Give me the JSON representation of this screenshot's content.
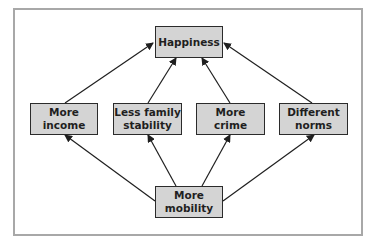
{
  "diagram": {
    "nodes": {
      "happiness": {
        "label": "Happiness"
      },
      "income": {
        "line1": "More",
        "line2": "income"
      },
      "family": {
        "line1": "Less family",
        "line2": "stability"
      },
      "crime": {
        "line1": "More",
        "line2": "crime"
      },
      "norms": {
        "line1": "Different",
        "line2": "norms"
      },
      "mobility": {
        "line1": "More",
        "line2": "mobility"
      }
    },
    "edges": [
      {
        "from": "income",
        "to": "happiness"
      },
      {
        "from": "family",
        "to": "happiness"
      },
      {
        "from": "crime",
        "to": "happiness"
      },
      {
        "from": "norms",
        "to": "happiness"
      },
      {
        "from": "mobility",
        "to": "income"
      },
      {
        "from": "mobility",
        "to": "family"
      },
      {
        "from": "mobility",
        "to": "crime"
      },
      {
        "from": "mobility",
        "to": "norms"
      }
    ],
    "colors": {
      "box_fill": "#d4d4d4",
      "box_border": "#2b2b2b",
      "frame": "#a8a8a8",
      "arrow": "#1f1f1f"
    }
  }
}
